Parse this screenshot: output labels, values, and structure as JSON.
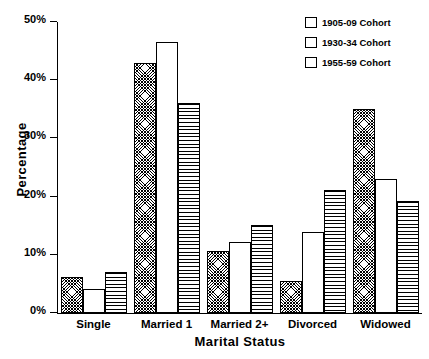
{
  "chart_data": {
    "type": "bar",
    "title": "",
    "xlabel": "Marital Status",
    "ylabel": "Percentage",
    "ylim": [
      0,
      50
    ],
    "ytick_labels": [
      "0%",
      "10%",
      "20%",
      "30%",
      "40%",
      "50%"
    ],
    "ytick_values": [
      0,
      10,
      20,
      30,
      40,
      50
    ],
    "grid": false,
    "legend_position": "top-right",
    "categories": [
      "Single",
      "Married 1",
      "Married 2+",
      "Divorced",
      "Widowed"
    ],
    "series": [
      {
        "name": "1905-09 Cohort",
        "pattern": "cross-hatch",
        "values": [
          6.2,
          43.0,
          10.7,
          5.5,
          35.0
        ]
      },
      {
        "name": "1930-34 Cohort",
        "pattern": "blank",
        "values": [
          4.2,
          46.5,
          12.2,
          14.0,
          23.0
        ]
      },
      {
        "name": "1955-59 Cohort",
        "pattern": "horizontal-lines",
        "values": [
          7.0,
          36.0,
          15.2,
          21.2,
          19.3
        ]
      }
    ]
  },
  "colors": {
    "axis": "#000000",
    "bar_outline": "#000000",
    "background": "#ffffff"
  }
}
